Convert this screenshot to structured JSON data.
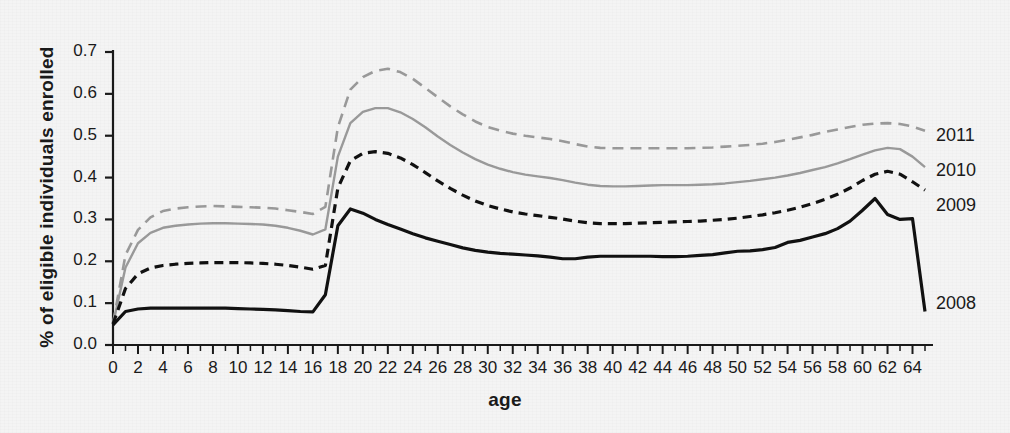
{
  "chart_data": {
    "type": "line",
    "title": "",
    "xlabel": "age",
    "ylabel": "% of eligible individuals enrolled",
    "xlim": [
      0,
      65
    ],
    "ylim": [
      0.0,
      0.7
    ],
    "grid": false,
    "legend_position": "right-inline",
    "y_ticks": [
      "0.0",
      "0.1",
      "0.2",
      "0.3",
      "0.4",
      "0.5",
      "0.6",
      "0.7"
    ],
    "y_tick_values": [
      0.0,
      0.1,
      0.2,
      0.3,
      0.4,
      0.5,
      0.6,
      0.7
    ],
    "x_ticks": [
      "0",
      "2",
      "4",
      "6",
      "8",
      "10",
      "12",
      "14",
      "16",
      "18",
      "20",
      "22",
      "24",
      "26",
      "28",
      "30",
      "32",
      "34",
      "36",
      "38",
      "40",
      "42",
      "44",
      "46",
      "48",
      "50",
      "52",
      "54",
      "56",
      "58",
      "60",
      "62",
      "64"
    ],
    "x_tick_values": [
      0,
      2,
      4,
      6,
      8,
      10,
      12,
      14,
      16,
      18,
      20,
      22,
      24,
      26,
      28,
      30,
      32,
      34,
      36,
      38,
      40,
      42,
      44,
      46,
      48,
      50,
      52,
      54,
      56,
      58,
      60,
      62,
      64
    ],
    "x": [
      0,
      1,
      2,
      3,
      4,
      5,
      6,
      7,
      8,
      9,
      10,
      11,
      12,
      13,
      14,
      15,
      16,
      17,
      18,
      19,
      20,
      21,
      22,
      23,
      24,
      25,
      26,
      27,
      28,
      29,
      30,
      31,
      32,
      33,
      34,
      35,
      36,
      37,
      38,
      39,
      40,
      41,
      42,
      43,
      44,
      45,
      46,
      47,
      48,
      49,
      50,
      51,
      52,
      53,
      54,
      55,
      56,
      57,
      58,
      59,
      60,
      61,
      62,
      63,
      64,
      65
    ],
    "series": [
      {
        "name": "2011",
        "color": "#9a9a9a",
        "style": "dashed",
        "width": 2.6,
        "values": [
          0.052,
          0.215,
          0.275,
          0.305,
          0.32,
          0.326,
          0.329,
          0.331,
          0.332,
          0.331,
          0.33,
          0.329,
          0.328,
          0.326,
          0.322,
          0.318,
          0.313,
          0.33,
          0.52,
          0.61,
          0.64,
          0.655,
          0.66,
          0.652,
          0.636,
          0.614,
          0.592,
          0.57,
          0.551,
          0.534,
          0.521,
          0.512,
          0.505,
          0.5,
          0.496,
          0.492,
          0.487,
          0.48,
          0.474,
          0.471,
          0.47,
          0.47,
          0.47,
          0.47,
          0.47,
          0.47,
          0.47,
          0.471,
          0.472,
          0.474,
          0.476,
          0.478,
          0.481,
          0.485,
          0.49,
          0.496,
          0.502,
          0.509,
          0.515,
          0.521,
          0.526,
          0.529,
          0.53,
          0.528,
          0.522,
          0.512
        ]
      },
      {
        "name": "2010",
        "color": "#9a9a9a",
        "style": "solid",
        "width": 2.4,
        "values": [
          0.05,
          0.185,
          0.243,
          0.268,
          0.28,
          0.285,
          0.288,
          0.29,
          0.291,
          0.291,
          0.29,
          0.289,
          0.288,
          0.285,
          0.28,
          0.273,
          0.264,
          0.276,
          0.45,
          0.53,
          0.557,
          0.566,
          0.566,
          0.556,
          0.54,
          0.52,
          0.498,
          0.478,
          0.46,
          0.444,
          0.431,
          0.421,
          0.413,
          0.407,
          0.403,
          0.399,
          0.394,
          0.388,
          0.383,
          0.38,
          0.379,
          0.379,
          0.38,
          0.381,
          0.382,
          0.382,
          0.382,
          0.383,
          0.384,
          0.386,
          0.389,
          0.392,
          0.396,
          0.4,
          0.405,
          0.411,
          0.418,
          0.425,
          0.434,
          0.444,
          0.455,
          0.465,
          0.471,
          0.468,
          0.45,
          0.425
        ]
      },
      {
        "name": "2009",
        "color": "#111111",
        "style": "dashed",
        "width": 3.2,
        "values": [
          0.05,
          0.135,
          0.17,
          0.184,
          0.19,
          0.193,
          0.195,
          0.196,
          0.197,
          0.197,
          0.197,
          0.196,
          0.195,
          0.193,
          0.19,
          0.186,
          0.181,
          0.19,
          0.375,
          0.44,
          0.458,
          0.462,
          0.458,
          0.447,
          0.431,
          0.412,
          0.392,
          0.374,
          0.358,
          0.344,
          0.333,
          0.325,
          0.318,
          0.313,
          0.309,
          0.305,
          0.301,
          0.296,
          0.292,
          0.29,
          0.29,
          0.29,
          0.291,
          0.292,
          0.293,
          0.294,
          0.295,
          0.296,
          0.298,
          0.3,
          0.303,
          0.307,
          0.311,
          0.316,
          0.322,
          0.329,
          0.338,
          0.348,
          0.36,
          0.375,
          0.393,
          0.408,
          0.415,
          0.408,
          0.39,
          0.37
        ]
      },
      {
        "name": "2008",
        "color": "#111111",
        "style": "solid",
        "width": 3.2,
        "values": [
          0.048,
          0.08,
          0.086,
          0.088,
          0.088,
          0.088,
          0.088,
          0.088,
          0.088,
          0.088,
          0.087,
          0.086,
          0.085,
          0.084,
          0.082,
          0.08,
          0.079,
          0.12,
          0.285,
          0.325,
          0.315,
          0.3,
          0.288,
          0.277,
          0.266,
          0.256,
          0.248,
          0.24,
          0.232,
          0.226,
          0.222,
          0.219,
          0.217,
          0.215,
          0.213,
          0.21,
          0.206,
          0.206,
          0.21,
          0.212,
          0.212,
          0.212,
          0.212,
          0.212,
          0.211,
          0.211,
          0.212,
          0.214,
          0.216,
          0.22,
          0.224,
          0.225,
          0.228,
          0.233,
          0.245,
          0.25,
          0.258,
          0.266,
          0.278,
          0.296,
          0.322,
          0.35,
          0.312,
          0.3,
          0.302,
          0.08
        ]
      }
    ]
  },
  "legend": {
    "entries": [
      {
        "label": "2011"
      },
      {
        "label": "2010"
      },
      {
        "label": "2009"
      },
      {
        "label": "2008"
      }
    ]
  }
}
